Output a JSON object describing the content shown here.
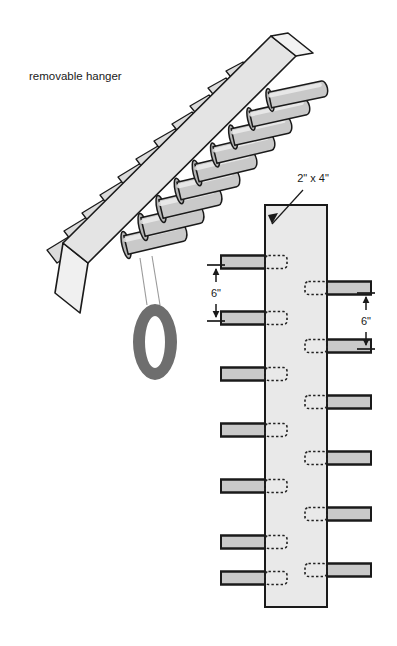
{
  "figure": {
    "background": "#ffffff"
  },
  "labels": {
    "removable_hanger": "removable hanger",
    "board_size": "2\" x 4\"",
    "spacing_left": "6\"",
    "spacing_right": "6\""
  },
  "colors": {
    "board_fill": "#e9e9e9",
    "board_fill_iso": "#e4e4e4",
    "peg_fill": "#c9c9c9",
    "peg_fill_light": "#dcdcdc",
    "outline": "#1a1a1a",
    "hidden_line": "#222222",
    "tire_fill": "#6e6e6e",
    "text": "#1a1a1a",
    "thin_line": "#9a9a9a"
  },
  "iso_view": {
    "name": "isometric-hanger-view",
    "board": {
      "face_points": "63,243 271,36 296,56 88,263",
      "top_points": "271,36 288,33 313,53 296,56",
      "end_points": "55,293 63,243 88,263 80,313",
      "front_end_points": "55,293 80,313 88,263",
      "side_points": "88,263 296,56 296,56 88,263"
    },
    "front_pegs": [
      {
        "bx": 126,
        "by": 245,
        "tx": 186,
        "ty": 231,
        "r": 9.5
      },
      {
        "bx": 143,
        "by": 227,
        "tx": 203,
        "ty": 213,
        "r": 9.5
      },
      {
        "bx": 161,
        "by": 209,
        "tx": 221,
        "ty": 195,
        "r": 9.5
      },
      {
        "bx": 179,
        "by": 191,
        "tx": 239,
        "ty": 177,
        "r": 9.0
      },
      {
        "bx": 197,
        "by": 173,
        "tx": 256,
        "ty": 159,
        "r": 9.0
      },
      {
        "bx": 215,
        "by": 155,
        "tx": 274,
        "ty": 141,
        "r": 8.5
      },
      {
        "bx": 233,
        "by": 137,
        "tx": 291,
        "ty": 124,
        "r": 8.5
      },
      {
        "bx": 251,
        "by": 119,
        "tx": 309,
        "ty": 106,
        "r": 8.0
      },
      {
        "bx": 270,
        "by": 100,
        "tx": 327,
        "ty": 88,
        "r": 8.0
      }
    ],
    "back_pegs": [
      {
        "points": "47,250 70,236 80,248 57,263"
      },
      {
        "points": "64,231 87,217 97,229 74,244"
      },
      {
        "points": "82,213 105,199 115,211 92,226"
      },
      {
        "points": "100,195 123,181 132,193 110,208"
      },
      {
        "points": "118,177 141,163 150,175 128,190"
      },
      {
        "points": "136,159 158,146 167,157 145,171"
      },
      {
        "points": "154,141 175,129 184,140 163,153"
      },
      {
        "points": "172,124 192,112 201,123 181,135"
      },
      {
        "points": "190,106 209,95 218,106 199,117"
      },
      {
        "points": "208,88 226,78 235,89 217,99"
      },
      {
        "points": "226,71 243,62 251,72 234,81"
      }
    ],
    "hanger": {
      "name": "hanging-tire",
      "cx": 155,
      "cy": 342,
      "rx": 22,
      "ry": 38,
      "inner_rx": 10,
      "inner_ry": 26,
      "rope_left": "140,258 147,305",
      "rope_right": "152,256 160,305"
    }
  },
  "elevation_view": {
    "name": "front-elevation-view",
    "board": {
      "x": 265,
      "y": 205,
      "width": 62,
      "height": 402
    },
    "callout": {
      "label_x": 313,
      "label_y": 182,
      "line": "303,190 272,224",
      "arrow": "272,224 278,213 268,215"
    },
    "peg_length": 44,
    "peg_height": 13,
    "mortise_depth": 22,
    "left_pegs_y": [
      262,
      318,
      374,
      430,
      486,
      542,
      578
    ],
    "right_pegs_y": [
      288,
      346,
      402,
      458,
      514,
      570
    ],
    "dim_left": {
      "x": 216,
      "top_y": 265,
      "bot_y": 321,
      "tick_half": 9,
      "label_x": 216,
      "label_y": 297
    },
    "dim_right": {
      "x": 366,
      "top_y": 293,
      "bot_y": 349,
      "tick_half": 9,
      "label_x": 366,
      "label_y": 325
    }
  },
  "annotations": {
    "hanger_label_x": 29,
    "hanger_label_y": 80
  }
}
